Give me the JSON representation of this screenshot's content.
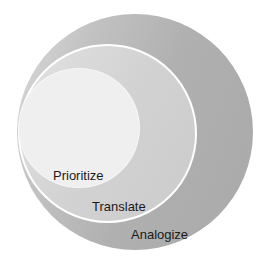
{
  "diagram": {
    "type": "nested-circles",
    "layers": [
      {
        "label": "Analogize",
        "level": "outer",
        "color": "#b0b0b0"
      },
      {
        "label": "Translate",
        "level": "middle",
        "color": "#cfcfcf"
      },
      {
        "label": "Prioritize",
        "level": "inner",
        "color": "#efefef"
      }
    ],
    "border_color": "#ffffff",
    "text_color": "#1a1a1a"
  }
}
